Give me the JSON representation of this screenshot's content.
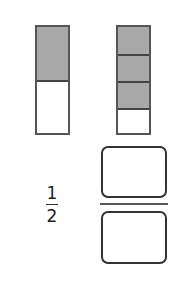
{
  "fraction_model": {
    "left_bar": {
      "total_parts": 2,
      "shaded_parts": 1,
      "shade_color": "#a8a8a8"
    },
    "right_bar": {
      "total_parts": 4,
      "shaded_parts": 3,
      "shade_color": "#a8a8a8"
    }
  },
  "given_fraction": {
    "numerator": "1",
    "denominator": "2"
  },
  "answer_fraction": {
    "numerator_value": "",
    "denominator_value": ""
  }
}
